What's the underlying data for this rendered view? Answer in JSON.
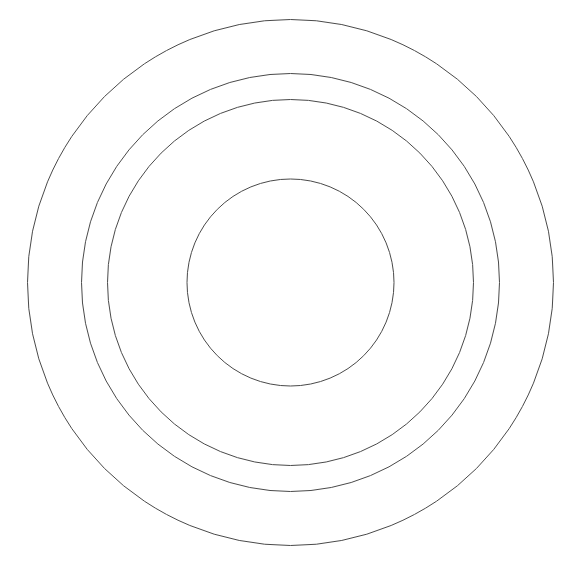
{
  "diagram": {
    "type": "concentric-circles",
    "background": "#ffffff",
    "stroke_color": "#4a4a4a",
    "stroke_width": 1,
    "center": {
      "x": 290.5,
      "y": 282.5
    },
    "circles": [
      {
        "name": "outer-circle",
        "r": 263
      },
      {
        "name": "second-circle",
        "r": 209
      },
      {
        "name": "third-circle",
        "r": 183
      },
      {
        "name": "inner-circle",
        "r": 103.5
      }
    ]
  }
}
